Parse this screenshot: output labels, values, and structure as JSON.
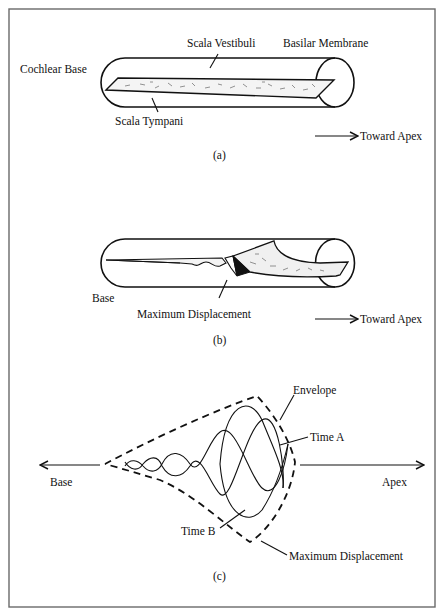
{
  "figure": {
    "panel_a": {
      "caption": "(a)",
      "labels": {
        "cochlear_base": "Cochlear Base",
        "scala_vestibuli": "Scala Vestibuli",
        "basilar_membrane": "Basilar Membrane",
        "scala_tympani": "Scala Tympani",
        "toward_apex": "Toward Apex"
      }
    },
    "panel_b": {
      "caption": "(b)",
      "labels": {
        "base": "Base",
        "maximum_displacement": "Maximum Displacement",
        "toward_apex": "Toward Apex"
      }
    },
    "panel_c": {
      "caption": "(c)",
      "labels": {
        "base": "Base",
        "apex": "Apex",
        "envelope": "Envelope",
        "time_a": "Time A",
        "time_b": "Time B",
        "maximum_displacement": "Maximum Displacement"
      }
    }
  },
  "colors": {
    "ink": "#111111",
    "frame": "#6a6a6a",
    "background": "#ffffff",
    "membrane_fill": "#f2f2f2",
    "displacement_fill": "#111111"
  }
}
